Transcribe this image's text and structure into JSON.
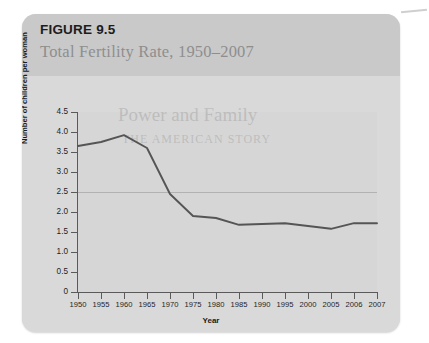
{
  "figure": {
    "number": "FIGURE 9.5",
    "subtitle": "Total Fertility Rate, 1950–2007"
  },
  "watermark": {
    "line1": "Power and Family",
    "line2": "THE AMERICAN STORY"
  },
  "colors": {
    "card_background": "#d9d9d9",
    "header_band": "#c9c9c9",
    "line": "#555555",
    "axis": "#5a5a5a",
    "subtitle_text": "#8e8e8e",
    "gridline": "#969696"
  },
  "chart_data": {
    "type": "line",
    "title": "Total Fertility Rate, 1950–2007",
    "xlabel": "Year",
    "ylabel": "Number of children per woman",
    "xlim": [
      1950,
      2007
    ],
    "ylim": [
      0,
      4.5
    ],
    "ytick_labels": [
      "4.5",
      "4.0",
      "3.5",
      "3.0",
      "2.5",
      "2.0",
      "1.5",
      "1.0",
      "0.5",
      "0"
    ],
    "ytick_values": [
      4.5,
      4.0,
      3.5,
      3.0,
      2.5,
      2.0,
      1.5,
      1.0,
      0.5,
      0
    ],
    "xtick_labels": [
      "1950",
      "1955",
      "1960",
      "1965",
      "1970",
      "1975",
      "1980",
      "1985",
      "1990",
      "1995",
      "2000",
      "2005",
      "2006",
      "2007"
    ],
    "grid": "single faint horizontal gridline near 2.5",
    "legend": "none",
    "x": [
      1950,
      1955,
      1960,
      1965,
      1970,
      1975,
      1980,
      1985,
      1990,
      1995,
      2000,
      2005,
      2006,
      2007
    ],
    "values": [
      3.65,
      3.75,
      3.92,
      3.6,
      2.45,
      1.9,
      1.85,
      1.68,
      1.7,
      1.72,
      1.65,
      1.58,
      1.72,
      1.72
    ],
    "series": [
      {
        "name": "Total Fertility Rate",
        "values": [
          3.65,
          3.75,
          3.92,
          3.6,
          2.45,
          1.9,
          1.85,
          1.68,
          1.7,
          1.72,
          1.65,
          1.58,
          1.72,
          1.72
        ]
      }
    ]
  }
}
